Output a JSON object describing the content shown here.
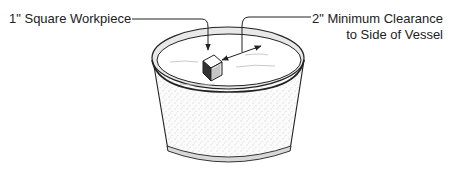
{
  "diagram": {
    "type": "technical-illustration",
    "labels": {
      "workpiece": "1\" Square Workpiece",
      "clearance_line1": "2\" Minimum Clearance",
      "clearance_line2": "to Side of Vessel"
    },
    "colors": {
      "line": "#222222",
      "rim_band": "#e6e6e6",
      "vessel_fill": "#f4f4f4",
      "background": "#ffffff"
    }
  }
}
